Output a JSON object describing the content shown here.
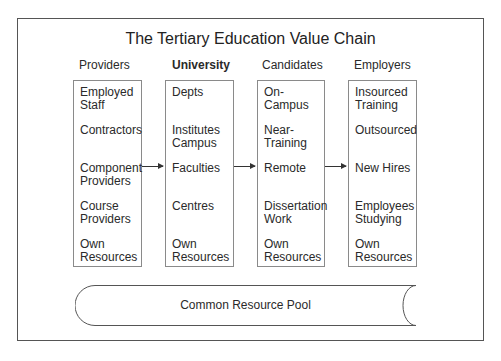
{
  "diagram": {
    "title": "The Tertiary Education Value Chain",
    "columns": [
      {
        "header": "Providers",
        "bold": false,
        "items": [
          "Employed\nStaff",
          "Contractors",
          "Component\nProviders",
          "Course\nProviders",
          "Own\nResources"
        ]
      },
      {
        "header": "University",
        "bold": true,
        "items": [
          "Depts",
          "Institutes\nCampus",
          "Faculties",
          "Centres",
          "Own\nResources"
        ]
      },
      {
        "header": "Candidates",
        "bold": false,
        "items": [
          "On-Campus",
          "Near-\nTraining",
          "Remote",
          "Dissertation\nWork",
          "Own\nResources"
        ]
      },
      {
        "header": "Employers",
        "bold": false,
        "items": [
          "Insourced\nTraining",
          "Outsourced",
          "New Hires",
          "Employees\nStudying",
          "Own\nResources"
        ]
      }
    ],
    "arrows": [
      {
        "from": "Component Providers",
        "to": "Faculties"
      },
      {
        "from": "Faculties",
        "to": "Remote"
      },
      {
        "from": "Remote",
        "to": "New Hires"
      }
    ],
    "pool": {
      "label": "Common Resource Pool",
      "shape": "horizontal-cylinder"
    },
    "colors": {
      "frame": "#555555",
      "box_border": "#8a8a8a",
      "text": "#2a2a2a"
    }
  }
}
